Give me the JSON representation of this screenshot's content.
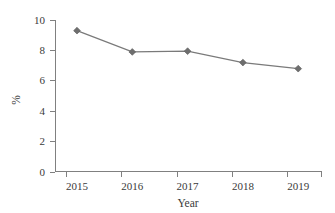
{
  "chart_data": {
    "type": "line",
    "title": "",
    "subtitle": "",
    "xlabel": "Year",
    "ylabel": "%",
    "categories": [
      "2015",
      "2016",
      "2017",
      "2018",
      "2019"
    ],
    "values": [
      9.3,
      7.9,
      7.95,
      7.2,
      6.8
    ],
    "series": [
      {
        "name": "",
        "values": [
          9.3,
          7.9,
          7.95,
          7.2,
          6.8
        ]
      }
    ],
    "x_tick_labels": [
      "2015",
      "2016",
      "2017",
      "2018",
      "2019"
    ],
    "y_tick_labels": [
      "0",
      "2",
      "4",
      "6",
      "8",
      "10"
    ],
    "y_tick_values": [
      0,
      2,
      4,
      6,
      8,
      10
    ],
    "ylim": [
      0,
      10
    ],
    "grid": false,
    "legend": false,
    "legend_position": "none",
    "marker": "diamond",
    "colors": {
      "line": "#7a7a7a",
      "marker": "#6e6e6e",
      "axis": "#808080",
      "text": "#3a3a3a",
      "background": "#ffffff"
    }
  },
  "axis": {
    "y_label": "%",
    "x_label": "Year"
  }
}
